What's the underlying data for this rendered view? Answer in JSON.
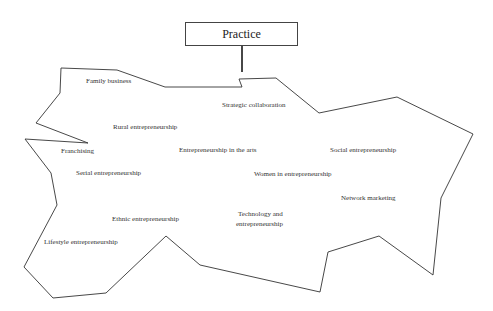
{
  "title": "Practice",
  "labels": {
    "family_business": "Family business",
    "strategic_collaboration": "Strategic collaboration",
    "rural_entrepreneurship": "Rural entrepreneurship",
    "franchising": "Franchising",
    "entrepreneurship_in_the_arts": "Entrepreneurship in the arts",
    "social_entrepreneurship": "Social entrepreneurship",
    "serial_entrepreneurship": "Serial entrepreneurship",
    "women_in_entrepreneurship": "Women in entrepreneurship",
    "network_marketing": "Network marketing",
    "ethnic_entrepreneurship": "Ethnic entrepreneurship",
    "technology_and_entrepreneurship_line1": "Technology and",
    "technology_and_entrepreneurship_line2": "entrepreneurship",
    "lifestyle_entrepreneurship": "Lifestyle entrepreneurship"
  },
  "colors": {
    "stroke": "#333333",
    "text": "#333333",
    "background": "#ffffff"
  }
}
